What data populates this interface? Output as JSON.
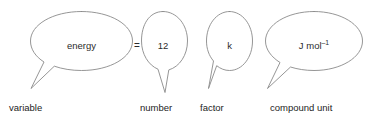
{
  "figure": {
    "background_color": "#ffffff",
    "outline_color": "#8a8a8a",
    "text_color": "#2b2b2b"
  },
  "equation": {
    "operator": "=",
    "terms": [
      {
        "id": "variable",
        "bubble_text": "energy",
        "caption": "variable",
        "bubble_shape": "wide-ellipse",
        "tail_direction": "down-left"
      },
      {
        "id": "number",
        "bubble_text": "12",
        "caption": "number",
        "bubble_shape": "narrow-ellipse",
        "tail_direction": "down"
      },
      {
        "id": "factor",
        "bubble_text_parts": {
          "base": "k",
          "sup": ""
        },
        "bubble_text": "k",
        "caption": "factor",
        "bubble_shape": "narrow-ellipse",
        "tail_direction": "down-left"
      },
      {
        "id": "compound-unit",
        "bubble_text_parts": {
          "base": "J mol",
          "sup": "–1"
        },
        "bubble_text": "J mol⁻¹",
        "caption": "compound unit",
        "bubble_shape": "wide-ellipse",
        "tail_direction": "down-left"
      }
    ]
  }
}
